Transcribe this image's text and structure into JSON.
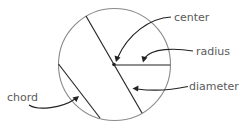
{
  "diagram": {
    "title": "",
    "labels": {
      "center": "center",
      "radius": "radius",
      "diameter": "diameter",
      "chord": "chord"
    },
    "circle": {
      "cx": 114.5,
      "cy": 64.5,
      "r": 56
    },
    "colors": {
      "outline": "#8a8a8a",
      "lines": "#2a2a2a",
      "text": "#5a5a5a",
      "background": "#ffffff"
    },
    "parts": [
      {
        "name": "center",
        "description": "point at the middle of the circle"
      },
      {
        "name": "radius",
        "description": "segment from center to edge"
      },
      {
        "name": "diameter",
        "description": "chord through the center"
      },
      {
        "name": "chord",
        "description": "segment joining two points on the circle"
      }
    ]
  }
}
